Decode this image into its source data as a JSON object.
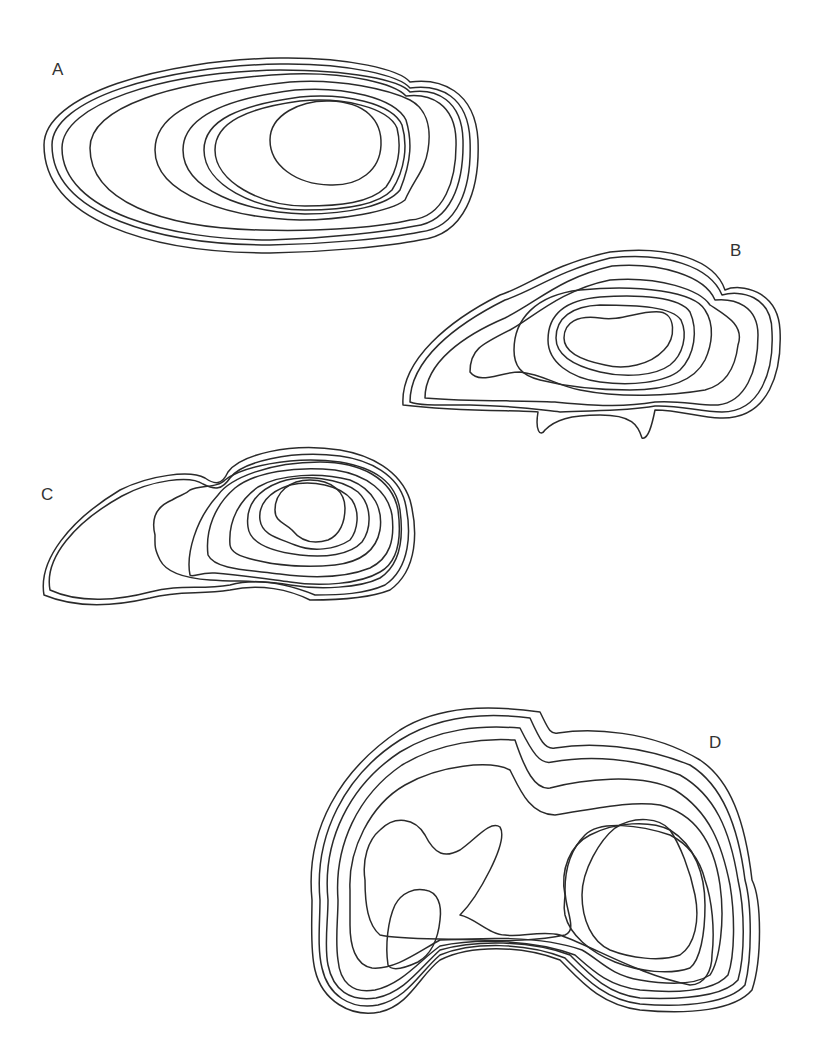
{
  "figure": {
    "line_color": "#2a2a2a",
    "background": "#ffffff",
    "panels": [
      {
        "label": "A",
        "label_pos": [
          52,
          75
        ],
        "shape": "elongated horizontal ellipse with concentric nested contours centered right-of-center",
        "contour_count": 9,
        "contours": [
          "M 44 145 C 44 95, 160 60, 280 58 C 350 57, 400 70, 410 82 C 440 78, 475 90, 478 140 C 480 190, 465 235, 420 240 C 390 246, 330 252, 270 253 C 150 253, 44 220, 44 145 Z",
          "M 52 145 C 52 100, 160 66, 280 64 C 350 63, 400 76, 410 88 C 440 84, 468 96, 470 140 C 472 188, 458 228, 420 232 C 390 238, 330 244, 270 245 C 160 245, 52 215, 52 145 Z",
          "M 62 148 C 62 105, 160 72, 280 70 C 350 70, 400 80, 410 92 C 436 88, 462 100, 463 140 C 464 185, 450 222, 415 226 C 385 232, 330 238, 270 240 C 170 240, 62 212, 62 148 Z",
          "M 90 148 C 90 108, 170 80, 290 74 C 350 72, 395 84, 406 96 C 430 93, 455 104, 456 140 C 457 180, 444 218, 410 220 C 385 226, 330 232, 260 230 C 160 228, 90 200, 90 148 Z",
          "M 155 150 C 155 110, 210 90, 290 82 C 340 78, 390 90, 410 100 C 425 108, 432 125, 428 150 C 425 170, 415 178, 405 200 C 390 212, 340 220, 300 220 C 230 218, 155 195, 155 150 Z",
          "M 183 150 C 183 116, 230 98, 295 90 C 345 86, 395 98, 406 120 C 412 140, 412 160, 400 190 C 388 205, 350 214, 305 214 C 245 212, 183 190, 183 150 Z",
          "M 204 150 C 204 120, 240 105, 300 97 C 345 93, 392 103, 402 125 C 408 145, 405 170, 392 190 C 378 205, 345 210, 305 210 C 255 210, 204 185, 204 150 Z",
          "M 215 150 C 215 122, 248 108, 300 101 C 342 97, 388 107, 397 128 C 402 148, 398 170, 386 187 C 370 203, 340 206, 305 206 C 262 206, 215 182, 215 150 Z",
          "M 270 140 C 270 115, 300 100, 330 101 C 365 102, 382 120, 381 145 C 380 170, 360 186, 330 185 C 295 184, 270 165, 270 140 Z"
        ]
      },
      {
        "label": "B",
        "label_pos": [
          730,
          256
        ],
        "shape": "irregular lozenge with kidney-shaped inner core and two small downward spikes at the base",
        "contour_count": 8,
        "contours": [
          "M 403 405 C 400 360, 450 320, 500 295 C 530 285, 550 265, 610 252 C 670 245, 715 260, 725 290 C 740 283, 778 290, 780 330 C 782 370, 770 420, 720 418 C 700 418, 680 410, 655 410 C 652 425, 648 440, 642 438 C 638 425, 632 415, 600 415 C 570 415, 555 420, 545 430 C 540 438, 535 430, 538 412 C 520 410, 460 412, 403 405 Z",
          "M 410 402 C 410 360, 455 325, 505 300 C 535 290, 555 272, 610 258 C 665 252, 710 266, 722 295 C 740 290, 772 295, 772 332 C 774 372, 760 412, 722 412 C 700 412, 680 405, 655 406 C 620 412, 590 410, 560 412 C 540 410, 520 406, 470 405 C 440 405, 420 406, 410 402 Z",
          "M 425 398 C 425 362, 465 335, 505 318 C 540 300, 560 278, 612 266 C 660 262, 705 276, 715 300 C 735 298, 758 306, 758 335 C 758 372, 745 402, 718 405 C 700 406, 680 400, 655 402 C 620 408, 590 405, 555 402 C 520 400, 470 402, 425 398 Z",
          "M 470 372 C 470 350, 480 345, 510 330 C 530 320, 560 290, 610 280 C 660 276, 700 290, 710 305 C 725 315, 745 325, 738 345 C 735 370, 725 385, 705 390 C 670 396, 620 398, 580 390 C 555 385, 545 375, 520 372 C 500 372, 480 385, 470 372 Z",
          "M 514 350 C 514 320, 535 295, 580 290 C 640 284, 695 292, 705 310 C 715 325, 712 345, 705 360 C 695 380, 670 390, 630 390 C 590 390, 560 385, 540 380 C 520 375, 514 365, 514 350 Z",
          "M 548 340 C 548 315, 565 300, 600 297 C 640 294, 680 297, 690 312 C 698 330, 695 355, 680 370 C 665 383, 630 386, 600 382 C 570 378, 548 362, 548 340 Z",
          "M 556 338 C 556 318, 572 306, 600 305 C 640 305, 672 307, 681 320 C 688 335, 683 355, 670 365 C 655 376, 625 378, 600 372 C 575 366, 556 356, 556 338 Z",
          "M 564 338 C 564 322, 578 315, 600 318 C 620 322, 640 310, 660 312 C 676 314, 676 338, 664 350 C 650 365, 625 370, 605 365 C 580 360, 564 352, 564 338 Z"
        ]
      },
      {
        "label": "C",
        "label_pos": [
          41,
          500
        ],
        "shape": "kidney/comma shape with large left lobe and concentric nested contours on the right lobe",
        "contour_count": 9,
        "contours": [
          "M 44 595 C 38 560, 70 520, 120 490 C 150 475, 190 470, 205 478 C 215 485, 222 485, 228 472 C 240 455, 290 442, 340 450 C 370 455, 400 470, 410 500 C 418 530, 418 570, 390 590 C 370 598, 340 600, 310 600 C 290 590, 260 583, 230 590 C 200 595, 180 590, 150 598 C 120 605, 80 610, 44 595 Z",
          "M 50 590 C 44 558, 75 522, 122 496 C 152 480, 190 475, 203 484 C 215 490, 222 490, 230 478 C 242 462, 290 450, 340 456 C 370 460, 398 475, 405 502 C 412 532, 410 568, 385 585 C 365 594, 340 595, 315 595 C 290 585, 260 577, 230 585 C 200 590, 180 584, 150 592 C 120 600, 80 604, 50 590 Z",
          "M 155 535 C 150 515, 160 505, 172 500 C 180 495, 185 495, 190 490 C 200 485, 218 488, 225 480 C 240 468, 290 455, 340 462 C 375 468, 396 482, 400 510 C 404 540, 400 565, 380 578 C 360 588, 320 590, 290 585 C 260 580, 240 582, 210 580 C 180 578, 165 570, 160 560 C 154 548, 155 545, 155 535 Z",
          "M 190 575 C 186 555, 195 520, 218 495 C 230 478, 270 462, 320 462 C 360 462, 392 478, 398 510 C 402 540, 398 562, 380 572 C 360 584, 320 587, 290 582 C 260 578, 240 575, 215 573 C 200 572, 192 578, 190 575 Z",
          "M 208 555 C 205 530, 215 505, 235 488 C 255 472, 295 466, 335 470 C 368 475, 388 492, 392 515 C 395 540, 390 558, 370 568 C 345 578, 310 578, 280 574 C 250 570, 215 570, 208 555 Z",
          "M 230 545 C 228 520, 240 500, 258 487 C 280 474, 320 472, 350 480 C 375 490, 383 510, 380 530 C 376 552, 360 562, 335 565 C 305 568, 275 565, 255 560 C 238 556, 231 552, 230 545 Z",
          "M 248 527 C 245 505, 258 490, 280 482 C 305 474, 340 478, 358 492 C 372 505, 372 528, 362 542 C 350 555, 325 558, 300 555 C 275 552, 250 545, 248 527 Z",
          "M 260 520 C 258 505, 268 492, 290 485 C 312 480, 340 485, 352 500 C 360 512, 358 530, 350 540 C 335 550, 312 552, 295 545 C 278 538, 262 535, 260 520 Z",
          "M 275 510 C 275 492, 290 480, 310 480 C 332 480, 345 492, 345 508 C 345 522, 340 535, 328 540 C 312 545, 300 540, 292 530 C 284 522, 275 522, 275 510 Z"
        ]
      },
      {
        "label": "D",
        "label_pos": [
          709,
          748
        ],
        "shape": "bean/heart-shaped cross-section with notch at top center and two inner lobes (left irregular, right triangular)",
        "contour_count": 9,
        "contours": [
          "M 312 900 C 305 830, 340 770, 400 730 C 440 705, 490 705, 540 712 C 548 728, 550 735, 558 733 C 590 728, 650 730, 700 760 C 730 780, 745 820, 752 880 C 762 900, 762 960, 752 990 C 735 1010, 690 1015, 640 1010 C 600 1005, 580 980, 560 960 C 520 945, 470 945, 440 960 C 420 975, 410 1005, 380 1012 C 350 1018, 322 1000, 315 970 C 310 950, 312 920, 312 900 Z",
          "M 320 900 C 314 835, 345 775, 400 740 C 440 715, 485 712, 530 718 C 540 740, 545 750, 555 748 C 590 742, 640 745, 690 765 C 722 785, 738 825, 745 880 C 752 905, 752 958, 745 985 C 730 1002, 690 1008, 640 1004 C 605 1000, 585 978, 565 958 C 525 942, 472 942, 440 955 C 420 972, 408 998, 378 1005 C 350 1010, 328 995, 322 968 C 317 948, 320 922, 320 900 Z",
          "M 328 900 C 322 840, 350 785, 400 752 C 440 728, 480 725, 520 728 C 532 752, 540 765, 552 762 C 590 755, 635 758, 680 775 C 715 795, 730 830, 738 880 C 745 910, 745 955, 738 980 C 725 995, 690 1000, 640 998 C 608 994, 590 975, 570 955 C 530 940, 475 940, 440 950 C 420 968, 405 992, 376 998 C 350 1002, 333 990, 328 965 C 324 945, 328 922, 328 900 Z",
          "M 338 900 C 334 845, 358 795, 402 765 C 440 742, 485 738, 515 740 C 525 770, 535 790, 550 788 C 580 780, 640 772, 675 790 C 710 812, 722 845, 730 885 C 735 915, 735 955, 728 975 C 715 990, 685 994, 640 990 C 608 986, 592 970, 575 955 C 535 940, 478 938, 440 946 C 418 962, 402 984, 375 990 C 352 994, 340 982, 338 960 C 335 940, 338 920, 338 900 Z",
          "M 350 890 C 348 850, 370 805, 405 785 C 440 765, 490 760, 510 770 C 520 790, 530 815, 555 815 C 590 810, 630 800, 660 805 C 700 815, 715 850, 720 885 C 725 920, 720 960, 710 975 C 695 985, 670 985, 640 980 C 610 975, 600 960, 582 950 C 540 935, 480 938, 440 940 C 418 952, 395 970, 372 968 C 355 965, 350 945, 350 925 C 350 910, 350 900, 350 890 Z",
          "M 365 880 C 362 860, 368 840, 380 830 C 395 815, 415 818, 425 835 C 435 855, 445 858, 460 850 C 475 840, 490 820, 500 827 C 505 835, 500 850, 490 870 C 480 890, 470 905, 460 915 C 475 918, 490 935, 505 935 C 520 938, 540 930, 560 935 C 600 950, 640 975, 690 985 C 705 985, 712 970, 712 955 C 715 930, 712 900, 705 880 C 700 860, 690 845, 670 835 C 640 825, 600 820, 585 835 C 570 850, 565 870, 565 890 C 565 910, 578 930, 565 935 C 540 940, 505 942, 480 940 C 440 938, 400 940, 380 935 C 368 925, 365 905, 365 880 Z",
          "M 565 895 C 560 870, 570 845, 590 835 C 615 822, 650 820, 670 830 C 695 845, 705 875, 705 905 C 705 935, 700 960, 690 968 C 670 975, 640 972, 615 962 C 590 952, 570 935, 565 915 C 563 905, 565 900, 565 895 Z",
          "M 582 895 C 582 870, 600 840, 615 828 C 635 815, 660 818, 670 830 C 680 845, 690 870, 695 895 C 700 920, 695 945, 680 955 C 660 962, 630 958, 610 950 C 592 942, 582 920, 582 895 Z",
          "M 388 965 C 385 945, 388 920, 395 905 C 402 892, 415 888, 425 890 C 438 892, 442 905, 440 920 C 438 940, 430 955, 418 962 C 405 968, 392 972, 388 965 Z"
        ]
      }
    ]
  },
  "chart_data": {
    "type": "contour",
    "title": "",
    "panels": [
      "A",
      "B",
      "C",
      "D"
    ],
    "panel_contour_counts": {
      "A": 9,
      "B": 8,
      "C": 9,
      "D": 9
    },
    "axes": "none",
    "legend": "none",
    "grid": false
  }
}
